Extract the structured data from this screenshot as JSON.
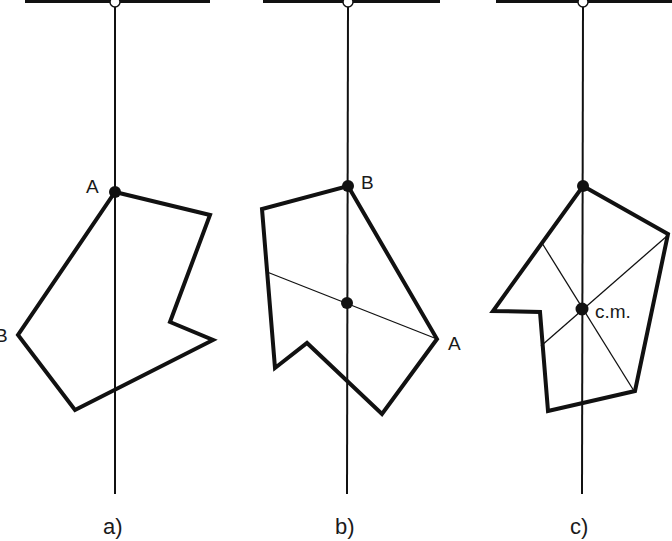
{
  "figure": {
    "colors": {
      "stroke": "#111111",
      "background": "#ffffff"
    },
    "panels": [
      {
        "id": "a",
        "caption": "a)",
        "suspension_point_label": "A",
        "second_point_label": "B",
        "support_bar": {
          "x1": 25,
          "x2": 210,
          "y": 0
        },
        "plumb_line_x": 115,
        "polygon": [
          [
            115,
            192
          ],
          [
            210,
            215
          ],
          [
            170,
            322
          ],
          [
            213,
            340
          ],
          [
            75,
            410
          ],
          [
            18,
            335
          ]
        ],
        "inner_lines": []
      },
      {
        "id": "b",
        "caption": "b)",
        "suspension_point_label": "B",
        "second_point_label": "A",
        "support_bar": {
          "x1": 263,
          "x2": 440,
          "y": 0
        },
        "plumb_line_x": 348,
        "polygon": [
          [
            348,
            186
          ],
          [
            437,
            339
          ],
          [
            382,
            414
          ],
          [
            307,
            343
          ],
          [
            275,
            368
          ],
          [
            262,
            209
          ]
        ],
        "inner_lines": [
          [
            [
              267,
              272
            ],
            [
              437,
              339
            ]
          ]
        ],
        "intersection": [
          347,
          303
        ]
      },
      {
        "id": "c",
        "caption": "c)",
        "center_label": "c.m.",
        "support_bar": {
          "x1": 496,
          "x2": 672,
          "y": 0
        },
        "plumb_line_x": 583,
        "polygon": [
          [
            583,
            186
          ],
          [
            668,
            234
          ],
          [
            635,
            391
          ],
          [
            548,
            411
          ],
          [
            540,
            312
          ],
          [
            493,
            311
          ]
        ],
        "inner_lines": [
          [
            [
              542,
              243
            ],
            [
              634,
              391
            ]
          ],
          [
            [
              541,
              346
            ],
            [
              667,
              236
            ]
          ]
        ],
        "intersection": [
          582,
          309
        ]
      }
    ]
  }
}
